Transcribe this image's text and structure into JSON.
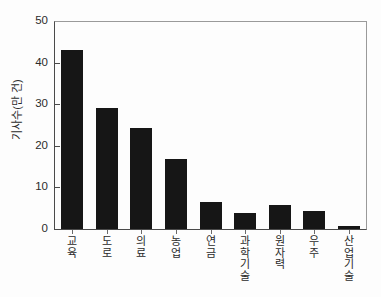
{
  "chart_data": {
    "type": "bar",
    "title": "",
    "subtitle": "",
    "xlabel": "",
    "ylabel": "기사수(만 건)",
    "categories": [
      "교육",
      "도로",
      "의료",
      "농업",
      "연금",
      "과학기술",
      "원자력",
      "우주",
      "산업기술"
    ],
    "values": [
      43.0,
      29.0,
      24.4,
      16.8,
      6.5,
      3.9,
      5.8,
      4.3,
      0.8
    ],
    "series": [
      {
        "name": "기사수",
        "values": [
          43.0,
          29.0,
          24.4,
          16.8,
          6.5,
          3.9,
          5.8,
          4.3,
          0.8
        ]
      }
    ],
    "ylim": [
      0,
      50
    ],
    "yticks": [
      0,
      10,
      20,
      30,
      40,
      50
    ],
    "ytick_labels": [
      "0",
      "10",
      "20",
      "30",
      "40",
      "50"
    ],
    "grid": false,
    "legend": false,
    "legend_position": "none",
    "bar_color": "#161616",
    "axis_color": "#4a4a4a",
    "background_color": "#fdfdfd",
    "annotations": []
  }
}
